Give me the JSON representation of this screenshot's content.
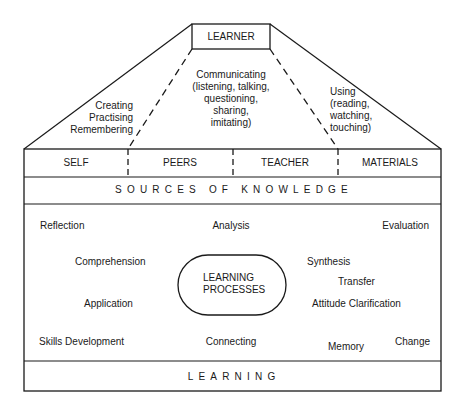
{
  "apex": {
    "label": "LEARNER"
  },
  "pathways": {
    "left": "Creating\nPractising\nRemembering",
    "center": "Communicating\n(listening, talking,\nquestioning,\nsharing,\nimitating)",
    "right": "Using\n(reading,\nwatching,\ntouching)"
  },
  "sources": {
    "cells": [
      "SELF",
      "PEERS",
      "TEACHER",
      "MATERIALS"
    ],
    "banner": "SOURCES OF KNOWLEDGE"
  },
  "processes": {
    "center": "LEARNING\nPROCESSES",
    "items": {
      "reflection": "Reflection",
      "analysis": "Analysis",
      "evaluation": "Evaluation",
      "comprehension": "Comprehension",
      "synthesis": "Synthesis",
      "transfer": "Transfer",
      "application": "Application",
      "attitude": "Attitude Clarification",
      "skills": "Skills Development",
      "connecting": "Connecting",
      "memory": "Memory",
      "change": "Change"
    }
  },
  "footer": {
    "banner": "LEARNING"
  }
}
